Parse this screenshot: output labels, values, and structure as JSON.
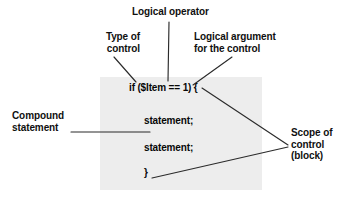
{
  "figure": {
    "panel_color": "#ededed",
    "line_color": "#2b2b2b",
    "text_color": "#101010"
  },
  "code_block": {
    "line_if": "if ($Item == 1) {",
    "line_statement_1": "statement;",
    "line_statement_2": "statement;",
    "line_close": "}"
  },
  "annotations": {
    "logical_operator": "Logical operator",
    "type_of_control": "Type of\ncontrol",
    "logical_argument": "Logical argument\nfor the control",
    "compound_statement": "Compound\nstatement",
    "scope_of_control": "Scope of\ncontrol\n(block)"
  }
}
